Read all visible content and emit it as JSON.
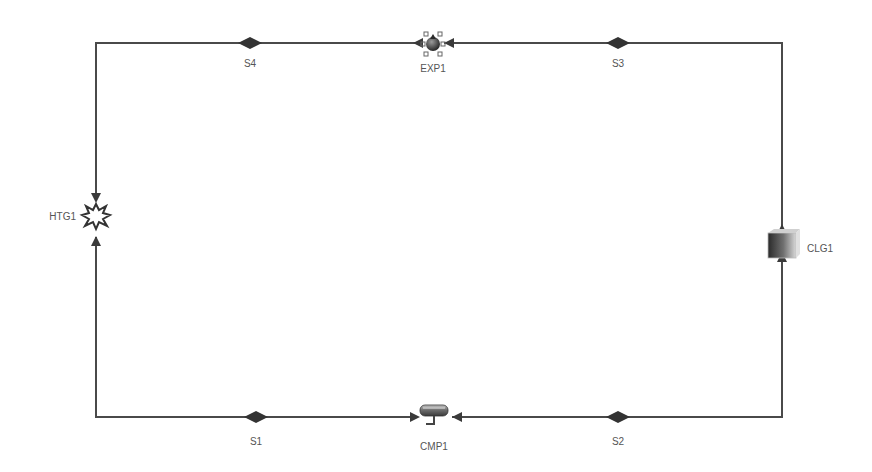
{
  "diagram": {
    "type": "process-flow-loop",
    "line_color": "#4a4a4a",
    "stream_marker_color": "#333333",
    "background": "#ffffff",
    "blocks": [
      {
        "id": "EXP1",
        "label": "EXP1",
        "icon": "expander-valve-icon",
        "x": 433,
        "y": 44
      },
      {
        "id": "HTG1",
        "label": "HTG1",
        "icon": "heater-burst-icon",
        "x": 96,
        "y": 216
      },
      {
        "id": "CMP1",
        "label": "CMP1",
        "icon": "compressor-icon",
        "x": 433,
        "y": 414
      },
      {
        "id": "CLG1",
        "label": "CLG1",
        "icon": "cooler-icon",
        "x": 782,
        "y": 246
      }
    ],
    "streams": [
      {
        "id": "S1",
        "label": "S1",
        "from": "HTG1",
        "to": "CMP1",
        "x": 256,
        "y": 417
      },
      {
        "id": "S2",
        "label": "S2",
        "from": "CMP1",
        "to": "CLG1",
        "x": 618,
        "y": 417
      },
      {
        "id": "S3",
        "label": "S3",
        "from": "CLG1",
        "to": "EXP1",
        "x": 618,
        "y": 43
      },
      {
        "id": "S4",
        "label": "S4",
        "from": "EXP1",
        "to": "HTG1",
        "x": 250,
        "y": 43
      }
    ]
  }
}
